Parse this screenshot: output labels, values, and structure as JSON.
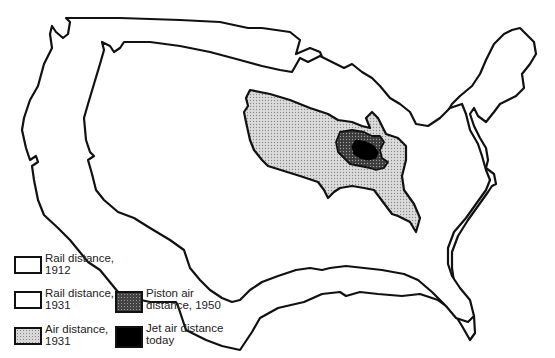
{
  "map": {
    "subject": "United States outline showing shrinking travel-time distance",
    "colors": {
      "outline": "#111111",
      "air_1931_fill": "#d8d8d8",
      "piston_fill": "#444444",
      "jet_fill": "#000000",
      "background": "#ffffff"
    }
  },
  "legend": {
    "items": [
      {
        "id": "rail-1912",
        "label": "Rail distance,\n1912",
        "swatch": "white-outline"
      },
      {
        "id": "rail-1931",
        "label": "Rail distance,\n1931",
        "swatch": "white-outline"
      },
      {
        "id": "air-1931",
        "label": "Air distance,\n1931",
        "swatch": "light-stipple"
      },
      {
        "id": "piston-1950",
        "label": "Piston air\ndistance, 1950",
        "swatch": "dark-stipple"
      },
      {
        "id": "jet-today",
        "label": "Jet air distance\ntoday",
        "swatch": "solid-black"
      }
    ]
  }
}
